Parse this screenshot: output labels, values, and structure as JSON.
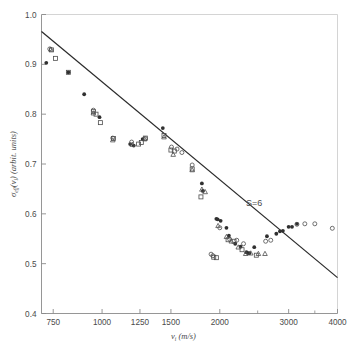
{
  "figure": {
    "width": 356,
    "height": 356,
    "background": "#ffffff",
    "line_color": "#2b2b2b",
    "marker_color": "#4c4c4c",
    "axis_color": "#8a8a8a",
    "text_color": "#4a4a4a"
  },
  "chart_data": {
    "type": "scatter",
    "title": "",
    "xlabel": "v_i (m/s)",
    "xlabel_parts": {
      "symbol": "v",
      "subscript": "i",
      "unit": "(m/s)"
    },
    "ylabel": "σ_eff(v_i) (arbit. units)",
    "ylabel_parts": {
      "symbol": "σ",
      "subscript": "eff",
      "arg": "(v",
      "arg_sub": "i",
      "arg_close": ")",
      "unit": "(arbit. units)"
    },
    "xscale": "log",
    "yscale": "linear",
    "xlim": [
      700,
      4000
    ],
    "ylim": [
      0.4,
      1.0
    ],
    "grid": false,
    "legend": false,
    "xticks": [
      750,
      1000,
      1250,
      1500,
      2000,
      3000,
      4000
    ],
    "xticklabels": [
      "750",
      "1000",
      "1250",
      "1500",
      "2000",
      "3000",
      "4000"
    ],
    "xminorticks": [
      2500,
      3500
    ],
    "yticks": [
      0.4,
      0.5,
      0.6,
      0.7,
      0.8,
      0.9,
      1.0
    ],
    "yticklabels": [
      "0.4",
      "0.5",
      "0.6",
      "0.7",
      "0.8",
      "0.9",
      "1.0"
    ],
    "annotations": [
      {
        "text": "S=6",
        "x": 2450,
        "y": 0.615
      }
    ],
    "fit_line": {
      "label": "S=6",
      "x": [
        700,
        4000
      ],
      "y": [
        0.966,
        0.472
      ],
      "style": "solid"
    },
    "series": [
      {
        "name": "filled-circle",
        "marker": "filled-circle",
        "points": [
          [
            720,
            0.903
          ],
          [
            820,
            0.884
          ],
          [
            900,
            0.84
          ],
          [
            985,
            0.794
          ],
          [
            1180,
            0.74
          ],
          [
            1205,
            0.737
          ],
          [
            1270,
            0.75
          ],
          [
            1430,
            0.772
          ],
          [
            1800,
            0.661
          ],
          [
            1810,
            0.646
          ],
          [
            1960,
            0.59
          ],
          [
            1975,
            0.589
          ],
          [
            2010,
            0.586
          ],
          [
            2080,
            0.572
          ],
          [
            2110,
            0.556
          ],
          [
            2190,
            0.54
          ],
          [
            2260,
            0.534
          ],
          [
            2340,
            0.523
          ],
          [
            2360,
            0.521
          ],
          [
            2380,
            0.521
          ],
          [
            2450,
            0.533
          ],
          [
            2640,
            0.555
          ],
          [
            2790,
            0.56
          ],
          [
            2850,
            0.565
          ],
          [
            2900,
            0.566
          ],
          [
            3000,
            0.574
          ],
          [
            3060,
            0.574
          ],
          [
            3150,
            0.58
          ]
        ]
      },
      {
        "name": "open-square",
        "marker": "open-square",
        "points": [
          [
            742,
            0.929
          ],
          [
            760,
            0.912
          ],
          [
            820,
            0.884
          ],
          [
            950,
            0.805
          ],
          [
            965,
            0.8
          ],
          [
            990,
            0.783
          ],
          [
            1070,
            0.751
          ],
          [
            1240,
            0.74
          ],
          [
            1260,
            0.743
          ],
          [
            1290,
            0.752
          ],
          [
            1440,
            0.757
          ],
          [
            1500,
            0.728
          ],
          [
            1530,
            0.726
          ],
          [
            1700,
            0.69
          ],
          [
            1790,
            0.634
          ],
          [
            1930,
            0.513
          ],
          [
            1960,
            0.512
          ],
          [
            2100,
            0.548
          ],
          [
            2175,
            0.545
          ],
          [
            2280,
            0.528
          ],
          [
            2480,
            0.517
          ]
        ]
      },
      {
        "name": "open-triangle",
        "marker": "open-triangle",
        "points": [
          [
            740,
            0.93
          ],
          [
            950,
            0.802
          ],
          [
            1065,
            0.748
          ],
          [
            1195,
            0.739
          ],
          [
            1285,
            0.75
          ],
          [
            1440,
            0.754
          ],
          [
            1520,
            0.719
          ],
          [
            1700,
            0.688
          ],
          [
            1800,
            0.649
          ],
          [
            1835,
            0.644
          ],
          [
            1980,
            0.576
          ],
          [
            2080,
            0.554
          ],
          [
            2140,
            0.545
          ],
          [
            2230,
            0.533
          ],
          [
            2330,
            0.52
          ],
          [
            2400,
            0.521
          ],
          [
            2510,
            0.52
          ],
          [
            2610,
            0.52
          ]
        ]
      },
      {
        "name": "open-circle",
        "marker": "open-circle",
        "points": [
          [
            735,
            0.931
          ],
          [
            950,
            0.808
          ],
          [
            1065,
            0.752
          ],
          [
            1190,
            0.744
          ],
          [
            1290,
            0.751
          ],
          [
            1505,
            0.734
          ],
          [
            1555,
            0.73
          ],
          [
            1600,
            0.723
          ],
          [
            1700,
            0.698
          ],
          [
            1900,
            0.519
          ],
          [
            1920,
            0.516
          ],
          [
            2000,
            0.572
          ],
          [
            2120,
            0.549
          ],
          [
            2210,
            0.547
          ],
          [
            2300,
            0.54
          ],
          [
            2620,
            0.545
          ],
          [
            2700,
            0.547
          ],
          [
            3150,
            0.579
          ],
          [
            3300,
            0.58
          ],
          [
            3500,
            0.58
          ],
          [
            3880,
            0.571
          ]
        ]
      }
    ]
  }
}
